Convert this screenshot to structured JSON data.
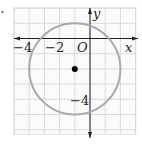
{
  "figure": {
    "bullet": "•",
    "grid": {
      "x_min": -5,
      "x_max": 3,
      "y_min": -6.3,
      "y_max": 2,
      "unit_px": 15.2,
      "origin_px": [
        90,
        38.5
      ],
      "line_color": "#d6d6d6",
      "border_color": "#e2e2e2"
    },
    "axes": {
      "x_label": "x",
      "y_label": "y",
      "origin_label": "O",
      "color": "#231f20"
    },
    "tick_labels": {
      "x": [
        {
          "value": -4,
          "text": "−4"
        },
        {
          "value": -2,
          "text": "−2"
        }
      ],
      "y": [
        {
          "value": -4,
          "text": "−4"
        }
      ]
    },
    "circle": {
      "center": [
        -1,
        -2
      ],
      "radius": 3,
      "stroke": "#a7a9ac"
    },
    "center_point": {
      "coords": [
        -1,
        -2
      ],
      "color": "#000000"
    }
  }
}
